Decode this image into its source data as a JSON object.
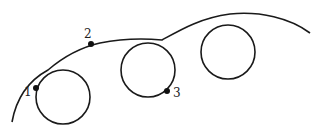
{
  "diagram": {
    "type": "trochoid-curve-with-loops",
    "stroke_color": "#1a1a1a",
    "background": "#ffffff",
    "points": [
      {
        "id": "1",
        "label": "1",
        "x": 36,
        "y": 88
      },
      {
        "id": "2",
        "label": "2",
        "x": 91,
        "y": 44
      },
      {
        "id": "3",
        "label": "3",
        "x": 167,
        "y": 91
      }
    ],
    "loops": [
      {
        "cx": 63,
        "cy": 97,
        "r": 27
      },
      {
        "cx": 148,
        "cy": 70,
        "r": 27
      },
      {
        "cx": 228,
        "cy": 52,
        "r": 27
      }
    ]
  }
}
